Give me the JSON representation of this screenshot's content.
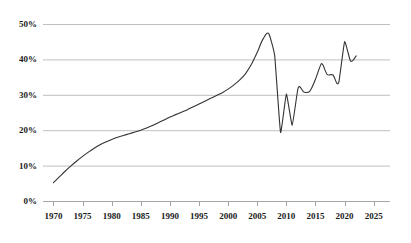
{
  "chart_data": {
    "type": "line",
    "title": "",
    "subtitle": "",
    "xlabel": "",
    "ylabel": "",
    "xlim": [
      1968.2,
      2027.8
    ],
    "ylim": [
      0,
      50
    ],
    "grid": true,
    "grid_axis": "y",
    "legend": "none",
    "line_color": "#333333",
    "grid_color": "#bfbfbf",
    "axis_color": "#a6a6a6",
    "background": "#ffffff",
    "x_ticks": [
      1970,
      1975,
      1980,
      1985,
      1990,
      1995,
      2000,
      2005,
      2010,
      2015,
      2020,
      2025
    ],
    "x_tick_labels": [
      "1970",
      "1975",
      "1980",
      "1985",
      "1990",
      "1995",
      "2000",
      "2005",
      "2010",
      "2015",
      "2020",
      "2025"
    ],
    "y_ticks": [
      0,
      10,
      20,
      30,
      40,
      50
    ],
    "y_tick_labels": [
      "0%",
      "10%",
      "20%",
      "30%",
      "40%",
      "50%"
    ],
    "series": [
      {
        "name": "series-1",
        "x": [
          1970,
          1971,
          1972,
          1973,
          1974,
          1975,
          1976,
          1977,
          1978,
          1979,
          1980,
          1981,
          1982,
          1983,
          1984,
          1985,
          1986,
          1987,
          1988,
          1989,
          1990,
          1991,
          1992,
          1993,
          1994,
          1995,
          1996,
          1997,
          1998,
          1999,
          2000,
          2001,
          2002,
          2003,
          2004,
          2005,
          2006,
          2007,
          2008,
          2009,
          2010,
          2011,
          2012,
          2013,
          2014,
          2015,
          2016,
          2017,
          2018,
          2019,
          2020,
          2021,
          2022
        ],
        "values": [
          5.2,
          6.8,
          8.4,
          9.9,
          11.3,
          12.6,
          13.8,
          14.9,
          15.9,
          16.7,
          17.4,
          18.0,
          18.5,
          19.0,
          19.5,
          20.0,
          20.6,
          21.3,
          22.1,
          22.9,
          23.7,
          24.4,
          25.1,
          25.8,
          26.6,
          27.4,
          28.2,
          29.0,
          29.8,
          30.6,
          31.6,
          32.8,
          34.2,
          36.0,
          38.6,
          42.0,
          45.8,
          47.2,
          41.0,
          19.4,
          30.2,
          21.4,
          31.8,
          30.8,
          31.0,
          34.4,
          38.8,
          35.8,
          35.6,
          33.5,
          45.0,
          39.6,
          41.0
        ]
      }
    ]
  },
  "axes": {
    "y_axis_name": "percentage-axis",
    "x_axis_name": "year-axis"
  }
}
